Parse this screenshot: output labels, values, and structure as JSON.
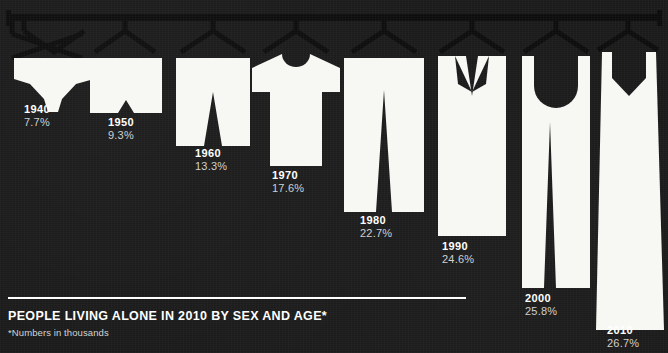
{
  "palette": {
    "background": "#191919",
    "garment": "#f7f7f4",
    "rail": "#0b0b0b",
    "text_primary": "#ffffff",
    "text_secondary": "#cfcfcf"
  },
  "footer": {
    "title": "PEOPLE LIVING ALONE IN 2010 BY SEX AND AGE*",
    "note": "*Numbers in thousands",
    "divider_width": 458
  },
  "chart_data": {
    "type": "bar",
    "title": "PEOPLE LIVING ALONE IN 2010 BY SEX AND AGE*",
    "subtitle": "*Numbers in thousands",
    "xlabel": "Year",
    "ylabel": "Percent of households living alone",
    "ylim": [
      0,
      30
    ],
    "grid": false,
    "legend": false,
    "units": "percent",
    "note": "Bars are drawn as hanging garments on a clothes rail; garment length encodes the value.",
    "categories": [
      "1940",
      "1950",
      "1960",
      "1970",
      "1980",
      "1990",
      "2000",
      "2010"
    ],
    "values": [
      7.7,
      9.3,
      13.3,
      17.6,
      22.7,
      24.6,
      25.8,
      26.7
    ],
    "value_labels": [
      "7.7%",
      "9.3%",
      "13.3%",
      "17.6%",
      "22.7%",
      "24.6%",
      "25.8%",
      "26.7%"
    ],
    "points": [
      {
        "year": "1940",
        "value": 7.7,
        "value_label": "7.7%",
        "garment": "briefs"
      },
      {
        "year": "1950",
        "value": 9.3,
        "value_label": "9.3%",
        "garment": "boxer-shorts"
      },
      {
        "year": "1960",
        "value": 13.3,
        "value_label": "13.3%",
        "garment": "shorts"
      },
      {
        "year": "1970",
        "value": 17.6,
        "value_label": "17.6%",
        "garment": "t-shirt"
      },
      {
        "year": "1980",
        "value": 22.7,
        "value_label": "22.7%",
        "garment": "trousers"
      },
      {
        "year": "1990",
        "value": 24.6,
        "value_label": "24.6%",
        "garment": "jacket"
      },
      {
        "year": "2000",
        "value": 25.8,
        "value_label": "25.8%",
        "garment": "overalls"
      },
      {
        "year": "2010",
        "value": 26.7,
        "value_label": "26.7%",
        "garment": "long-dress"
      }
    ]
  },
  "labels": [
    {
      "year": "1940",
      "pct": "7.7%"
    },
    {
      "year": "1950",
      "pct": "9.3%"
    },
    {
      "year": "1960",
      "pct": "13.3%"
    },
    {
      "year": "1970",
      "pct": "17.6%"
    },
    {
      "year": "1980",
      "pct": "22.7%"
    },
    {
      "year": "1990",
      "pct": "24.6%"
    },
    {
      "year": "2000",
      "pct": "25.8%"
    },
    {
      "year": "2010",
      "pct": "26.7%"
    }
  ]
}
